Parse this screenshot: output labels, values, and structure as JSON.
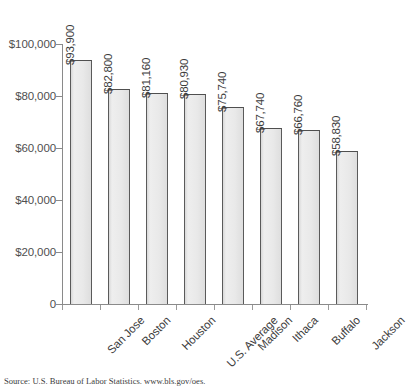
{
  "chart_data": {
    "type": "bar",
    "title": "",
    "xlabel": "",
    "ylabel": "",
    "ylim": [
      0,
      100000
    ],
    "grid": false,
    "legend": null,
    "ytick_labels": [
      "$100,000",
      "$80,000",
      "$60,000",
      "$40,000",
      "$20,000",
      "0"
    ],
    "ytick_values": [
      100000,
      80000,
      60000,
      40000,
      20000,
      0
    ],
    "categories": [
      "San Jose",
      "Boston",
      "Houston",
      "U.S. Average",
      "Madison",
      "Ithaca",
      "Buffalo",
      "Jackson"
    ],
    "values": [
      93900,
      82800,
      81160,
      80930,
      75740,
      67740,
      66760,
      58830
    ],
    "data_labels": [
      "$93,900",
      "$82,800",
      "$81,160",
      "$80,930",
      "$75,740",
      "$67,740",
      "$66,760",
      "$58,830"
    ],
    "colors": {
      "bar_fill": "#e9e9e9",
      "bar_border": "#565656",
      "axis": "#8a8a8a",
      "text": "#3c3c3c",
      "background": "#ffffff"
    }
  },
  "footer": {
    "source": "Source: U.S. Bureau of Labor Statistics. www.bls.gov/oes."
  }
}
